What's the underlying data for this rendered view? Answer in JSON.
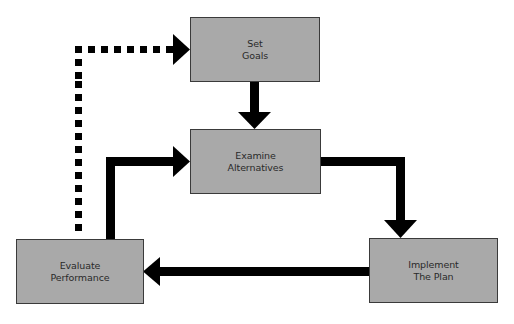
{
  "diagram": {
    "type": "process-cycle",
    "colors": {
      "box_fill": "#a9a9a9",
      "box_border": "#3a3a3a",
      "arrow": "#000000",
      "text": "#2a2a2a",
      "background": "#ffffff"
    },
    "nodes": [
      {
        "id": "set-goals",
        "line1": "Set",
        "line2": "Goals"
      },
      {
        "id": "examine-alternatives",
        "line1": "Examine",
        "line2": "Alternatives"
      },
      {
        "id": "implement-the-plan",
        "line1": "Implement",
        "line2": "The Plan"
      },
      {
        "id": "evaluate-performance",
        "line1": "Evaluate",
        "line2": "Performance"
      }
    ],
    "edges": [
      {
        "from": "set-goals",
        "to": "examine-alternatives",
        "style": "solid"
      },
      {
        "from": "examine-alternatives",
        "to": "implement-the-plan",
        "style": "solid"
      },
      {
        "from": "implement-the-plan",
        "to": "evaluate-performance",
        "style": "solid"
      },
      {
        "from": "evaluate-performance",
        "to": "examine-alternatives",
        "style": "solid"
      },
      {
        "from": "evaluate-performance",
        "to": "set-goals",
        "style": "dotted"
      }
    ]
  }
}
